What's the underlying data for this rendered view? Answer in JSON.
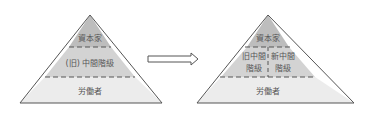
{
  "diagram": {
    "before": {
      "layers": [
        {
          "label": "資本家"
        },
        {
          "label": "(旧) 中間階級"
        },
        {
          "label": "労働者"
        }
      ]
    },
    "arrow": {
      "direction": "right"
    },
    "after": {
      "layers": [
        {
          "label": "資本家"
        },
        {
          "left_label_line1": "旧中間",
          "left_label_line2": "階級",
          "right_label_line1": "新中間",
          "right_label_line2": "階級"
        },
        {
          "label": "労働者"
        }
      ]
    },
    "colors": {
      "top": "#bdbdbd",
      "middle": "#d3d3d3",
      "bottom": "#ececec",
      "outline": "#555555",
      "text": "#555555"
    }
  }
}
